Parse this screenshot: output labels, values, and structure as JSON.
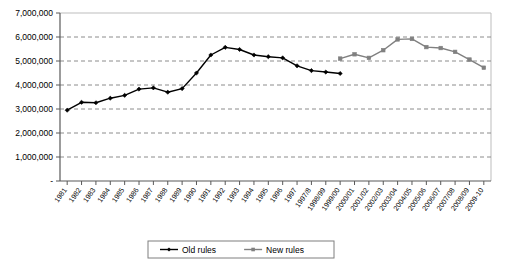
{
  "chart_data": {
    "type": "line",
    "title": "",
    "xlabel": "",
    "ylabel": "",
    "ylim": [
      0,
      7000000
    ],
    "ytick_values": [
      0,
      1000000,
      2000000,
      3000000,
      4000000,
      5000000,
      6000000,
      7000000
    ],
    "ytick_labels": [
      "-",
      "1,000,000",
      "2,000,000",
      "3,000,000",
      "4,000,000",
      "5,000,000",
      "6,000,000",
      "7,000,000"
    ],
    "grid": "horizontal-dashed",
    "legend_position": "bottom",
    "categories": [
      "1981",
      "1982",
      "1983",
      "1984",
      "1985",
      "1986",
      "1987",
      "1988",
      "1989",
      "1990",
      "1991",
      "1992",
      "1993",
      "1994",
      "1995",
      "1996",
      "1997",
      "1997/8",
      "1998/99",
      "1999/00",
      "2000/01",
      "2001/02",
      "2002/03",
      "2003/04",
      "2004/05",
      "2005/06",
      "2006/07",
      "2007/08",
      "2008/09",
      "2009-10"
    ],
    "series": [
      {
        "name": "Old rules",
        "color": "#000000",
        "marker": "diamond",
        "values": [
          2950000,
          3280000,
          3260000,
          3450000,
          3570000,
          3830000,
          3880000,
          3700000,
          3850000,
          4500000,
          5250000,
          5570000,
          5480000,
          5250000,
          5180000,
          5130000,
          4800000,
          4600000,
          4540000,
          4480000,
          null,
          null,
          null,
          null,
          null,
          null,
          null,
          null,
          null,
          null
        ]
      },
      {
        "name": "New rules",
        "color": "#808080",
        "marker": "square",
        "values": [
          null,
          null,
          null,
          null,
          null,
          null,
          null,
          null,
          null,
          null,
          null,
          null,
          null,
          null,
          null,
          null,
          null,
          null,
          null,
          5100000,
          5280000,
          5130000,
          5450000,
          5900000,
          5920000,
          5580000,
          5540000,
          5380000,
          5060000,
          4720000
        ]
      }
    ]
  },
  "legend": {
    "items": [
      {
        "label": "Old rules",
        "color": "#000000"
      },
      {
        "label": "New rules",
        "color": "#808080"
      }
    ]
  }
}
